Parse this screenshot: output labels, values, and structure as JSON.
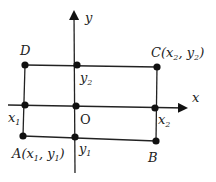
{
  "diagram": {
    "axes": {
      "x_label": "x",
      "y_label": "y",
      "origin_label": "O"
    },
    "points": {
      "A": {
        "name": "A",
        "coords_open": "(x",
        "sub1": "1",
        "comma": ", y",
        "sub2": "1",
        "close": ")"
      },
      "B": {
        "name": "B"
      },
      "C": {
        "name": "C",
        "coords_open": "(x",
        "sub1": "2",
        "comma": ", y",
        "sub2": "2",
        "close": ")"
      },
      "D": {
        "name": "D"
      }
    },
    "ticks": {
      "x1": {
        "base": "x",
        "sub": "1"
      },
      "x2": {
        "base": "x",
        "sub": "2"
      },
      "y1": {
        "base": "y",
        "sub": "1"
      },
      "y2": {
        "base": "y",
        "sub": "2"
      }
    },
    "colors": {
      "stroke": "#222222",
      "dot": "#111111",
      "background": "#ffffff"
    }
  }
}
